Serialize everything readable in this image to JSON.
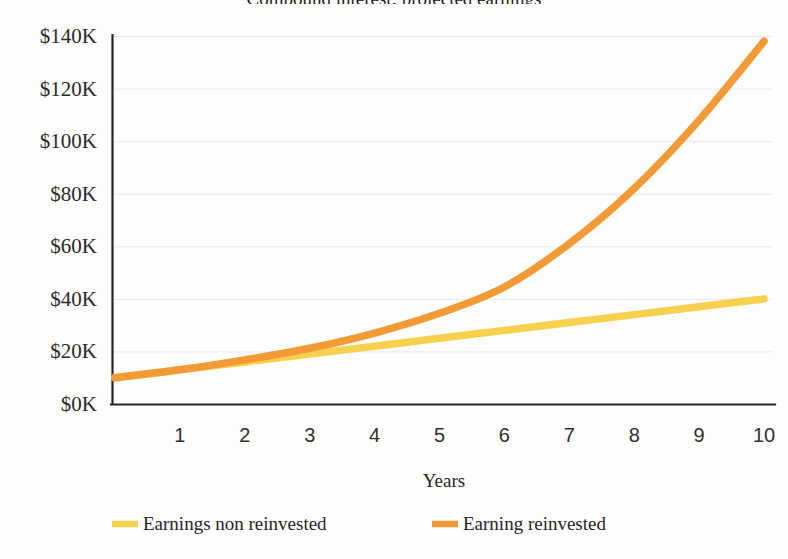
{
  "chart_data": {
    "type": "line",
    "title": "Compound interest: projected earnings",
    "xlabel": "Years",
    "ylabel": "",
    "x": [
      0,
      1,
      2,
      3,
      4,
      5,
      6,
      7,
      8,
      9,
      10
    ],
    "xlim": [
      0,
      10
    ],
    "ylim": [
      0,
      140000
    ],
    "grid": true,
    "legend_position": "bottom",
    "xticks": [
      "1",
      "2",
      "3",
      "4",
      "5",
      "6",
      "7",
      "8",
      "9",
      "10"
    ],
    "yticks": [
      "$0K",
      "$20K",
      "$40K",
      "$60K",
      "$80K",
      "$100K",
      "$120K",
      "$140K"
    ],
    "ytick_values": [
      0,
      20000,
      40000,
      60000,
      80000,
      100000,
      120000,
      140000
    ],
    "series": [
      {
        "name": "Earnings non reinvested",
        "color": "#f7d14e",
        "values": [
          10000,
          13000,
          16000,
          19000,
          22000,
          25000,
          28000,
          31000,
          34000,
          37000,
          40000
        ]
      },
      {
        "name": "Earning reinvested",
        "color": "#f29a36",
        "values": [
          10000,
          13000,
          16800,
          21200,
          27000,
          34500,
          44500,
          61000,
          82000,
          108000,
          138000
        ]
      }
    ]
  },
  "axis": {
    "x_title": "Years"
  },
  "legend": {
    "items": [
      {
        "label": "Earnings non reinvested",
        "color": "#f7d14e"
      },
      {
        "label": "Earning reinvested",
        "color": "#f29a36"
      }
    ]
  }
}
